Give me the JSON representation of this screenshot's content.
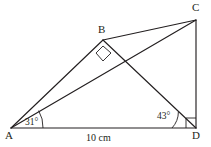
{
  "figure": {
    "stroke_color": "#231f20",
    "background_color": "#ffffff",
    "vertices": [
      {
        "name": "A",
        "label": "A",
        "x": 11,
        "y": 128
      },
      {
        "name": "B",
        "label": "B",
        "x": 103,
        "y": 40
      },
      {
        "name": "C",
        "label": "C",
        "x": 196,
        "y": 20
      },
      {
        "name": "D",
        "label": "D",
        "x": 196,
        "y": 128
      }
    ],
    "segments": [
      {
        "name": "segment-AD",
        "from": "A",
        "to": "D"
      },
      {
        "name": "segment-AB",
        "from": "A",
        "to": "B"
      },
      {
        "name": "segment-AC",
        "from": "A",
        "to": "C"
      },
      {
        "name": "segment-BC",
        "from": "B",
        "to": "C"
      },
      {
        "name": "segment-BD",
        "from": "B",
        "to": "D"
      },
      {
        "name": "segment-CD",
        "from": "C",
        "to": "D"
      }
    ],
    "angles": [
      {
        "name": "angle-at-A",
        "label": "31°",
        "vertex": "A",
        "between": [
          "AD",
          "AB"
        ]
      },
      {
        "name": "angle-at-D",
        "label": "43°",
        "vertex": "D",
        "between": [
          "DA",
          "DB"
        ]
      }
    ],
    "right_angles": [
      {
        "name": "right-angle-at-B",
        "vertex": "B",
        "marker": "square"
      },
      {
        "name": "right-angle-at-D",
        "vertex": "D",
        "marker": "square"
      }
    ],
    "side_labels": [
      {
        "name": "side-label-AD",
        "label": "10 cm",
        "side": "AD"
      }
    ]
  }
}
